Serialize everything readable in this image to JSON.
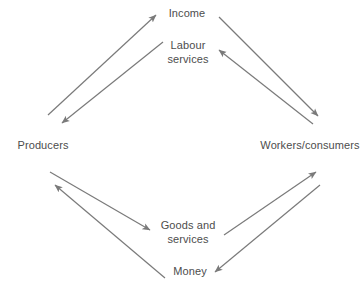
{
  "diagram": {
    "type": "circular-flow",
    "title": "",
    "width": 362,
    "height": 294,
    "background_color": "#ffffff",
    "line_color": "#7a7a7a",
    "text_color": "#4d4d4d",
    "nodes": [
      {
        "id": "producers",
        "label": "Producers",
        "x": 43,
        "y": 146
      },
      {
        "id": "workers",
        "label": "Workers/consumers",
        "x": 310,
        "y": 146
      }
    ],
    "flow_labels": [
      {
        "id": "income",
        "label": "Income",
        "x": 187,
        "y": 14
      },
      {
        "id": "labour-services",
        "label": "Labour\nservices",
        "x": 188,
        "y": 52
      },
      {
        "id": "goods-and-services",
        "label": "Goods and\nservices",
        "x": 188,
        "y": 232
      },
      {
        "id": "money",
        "label": "Money",
        "x": 190,
        "y": 272
      }
    ],
    "arrows": [
      {
        "id": "producers-to-income",
        "from": "producers",
        "to": "income",
        "flow": "Income",
        "direction": "up-right",
        "x1": 48,
        "y1": 115,
        "x2": 156,
        "y2": 15
      },
      {
        "id": "income-to-producers",
        "from": "income",
        "to": "producers",
        "flow": "Labour services",
        "direction": "down-left",
        "x1": 163,
        "y1": 42,
        "x2": 62,
        "y2": 123
      },
      {
        "id": "income-to-workers",
        "from": "income",
        "to": "workers",
        "flow": "Income",
        "direction": "down-right",
        "x1": 219,
        "y1": 17,
        "x2": 318,
        "y2": 116
      },
      {
        "id": "workers-to-labour",
        "from": "workers",
        "to": "labour-services",
        "flow": "Labour services",
        "direction": "up-left",
        "x1": 313,
        "y1": 124,
        "x2": 219,
        "y2": 50
      },
      {
        "id": "producers-to-goods",
        "from": "producers",
        "to": "goods-and-services",
        "flow": "Goods and services",
        "direction": "down-right",
        "x1": 50,
        "y1": 172,
        "x2": 150,
        "y2": 230
      },
      {
        "id": "money-to-producers",
        "from": "money",
        "to": "producers",
        "flow": "Money",
        "direction": "up-left",
        "x1": 165,
        "y1": 278,
        "x2": 55,
        "y2": 185
      },
      {
        "id": "goods-to-workers",
        "from": "goods-and-services",
        "to": "workers",
        "flow": "Goods and services",
        "direction": "up-right",
        "x1": 224,
        "y1": 235,
        "x2": 316,
        "y2": 172
      },
      {
        "id": "workers-to-money",
        "from": "workers",
        "to": "money",
        "flow": "Money",
        "direction": "down-left",
        "x1": 320,
        "y1": 185,
        "x2": 215,
        "y2": 272
      }
    ]
  }
}
